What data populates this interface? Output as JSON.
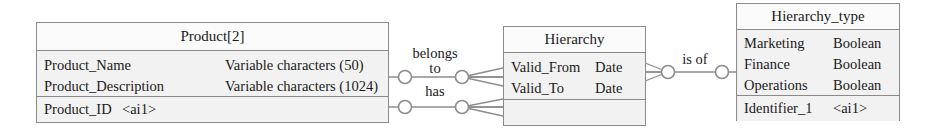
{
  "diagram": {
    "type": "entity-relationship-diagram",
    "notation": "crow's foot",
    "entities": [
      {
        "id": "product",
        "title": "Product[2]",
        "attributes": [
          {
            "name": "Product_Name",
            "type": "Variable characters (50)"
          },
          {
            "name": "Product_Description",
            "type": "Variable characters (1024)"
          }
        ],
        "identifiers": [
          {
            "name": "Product_ID",
            "code": "<ai1>"
          }
        ]
      },
      {
        "id": "hierarchy",
        "title": "Hierarchy",
        "attributes": [
          {
            "name": "Valid_From",
            "type": "Date"
          },
          {
            "name": "Valid_To",
            "type": "Date"
          }
        ],
        "identifiers": []
      },
      {
        "id": "hierarchy_type",
        "title": "Hierarchy_type",
        "attributes": [
          {
            "name": "Marketing",
            "type": "Boolean"
          },
          {
            "name": "Finance",
            "type": "Boolean"
          },
          {
            "name": "Operations",
            "type": "Boolean"
          }
        ],
        "identifiers": [
          {
            "name": "Identifier_1",
            "code": "<ai1>"
          }
        ]
      }
    ],
    "relationships": [
      {
        "id": "belongs-to",
        "label": "belongs\nto",
        "from": "product",
        "to": "hierarchy"
      },
      {
        "id": "has",
        "label": "has",
        "from": "product",
        "to": "hierarchy"
      },
      {
        "id": "is-of",
        "label": "is of",
        "from": "hierarchy",
        "to": "hierarchy_type"
      }
    ],
    "colors": {
      "box_border": "#8a8a8a",
      "box_fill": "#f2f2f2",
      "title_fill": "#fbfbfb",
      "line": "#8d8d8d",
      "text": "#1a1a1a",
      "background": "#ffffff"
    }
  }
}
